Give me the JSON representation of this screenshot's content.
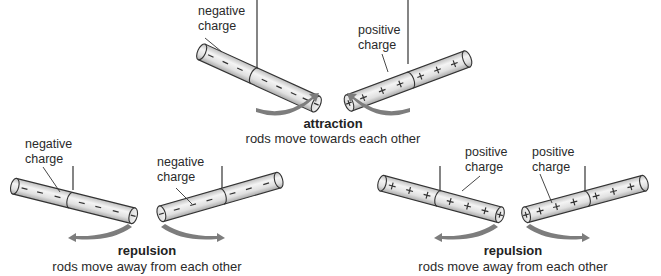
{
  "scenes": {
    "attraction": {
      "title": "attraction",
      "caption": "rods move towards each other",
      "left_rod": {
        "label_line1": "negative",
        "label_line2": "charge",
        "sign": "−"
      },
      "right_rod": {
        "label_line1": "positive",
        "label_line2": "charge",
        "sign": "+"
      }
    },
    "repulsion_negative": {
      "title": "repulsion",
      "caption": "rods move away from each other",
      "left_rod": {
        "label_line1": "negative",
        "label_line2": "charge",
        "sign": "−"
      },
      "right_rod": {
        "label_line1": "negative",
        "label_line2": "charge",
        "sign": "−"
      }
    },
    "repulsion_positive": {
      "title": "repulsion",
      "caption": "rods move away from each other",
      "left_rod": {
        "label_line1": "positive",
        "label_line2": "charge",
        "sign": "+"
      },
      "right_rod": {
        "label_line1": "positive",
        "label_line2": "charge",
        "sign": "+"
      }
    }
  },
  "colors": {
    "rod_fill": "#e4e4e4",
    "rod_outline": "#333333",
    "arrow": "#7d7d7d",
    "string": "#333333"
  }
}
